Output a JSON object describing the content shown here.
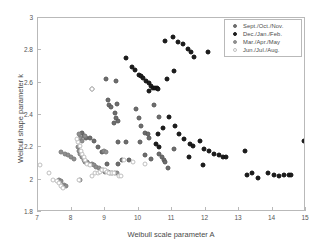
{
  "chart_data": {
    "type": "scatter",
    "title": "",
    "xlabel": "Weibull scale parameter A",
    "ylabel": "Weibull shape parameter k",
    "xlim": [
      7,
      15
    ],
    "ylim": [
      1.8,
      3
    ],
    "xticks": [
      "7",
      "8",
      "9",
      "10",
      "11",
      "12",
      "13",
      "14",
      "15"
    ],
    "yticks": [
      "1.8",
      "2",
      "2.2",
      "2.4",
      "2.6",
      "2.8",
      "3"
    ],
    "grid": false,
    "legend_position": "top-right",
    "series": [
      {
        "name": "Sept./Oct./Nov.",
        "color": "#6d6d6d",
        "marker": "filled-circle-gray",
        "points": [
          [
            8.62,
            2.56
          ],
          [
            9.02,
            2.62
          ],
          [
            9.08,
            2.49
          ],
          [
            9.32,
            2.61
          ],
          [
            9.13,
            2.46
          ],
          [
            9.18,
            2.45
          ],
          [
            9.36,
            2.47
          ],
          [
            9.3,
            2.41
          ],
          [
            9.33,
            2.38
          ],
          [
            9.4,
            2.36
          ],
          [
            9.28,
            2.35
          ],
          [
            9.93,
            2.44
          ],
          [
            10.02,
            2.38
          ],
          [
            10.08,
            2.33
          ],
          [
            10.2,
            2.29
          ],
          [
            10.28,
            2.28
          ],
          [
            10.32,
            2.26
          ],
          [
            10.47,
            2.46
          ],
          [
            10.6,
            2.39
          ],
          [
            10.05,
            2.23
          ],
          [
            9.62,
            2.23
          ],
          [
            9.4,
            2.23
          ],
          [
            10.18,
            2.15
          ],
          [
            10.38,
            2.13
          ],
          [
            10.62,
            2.16
          ],
          [
            10.7,
            2.14
          ],
          [
            10.75,
            2.12
          ],
          [
            10.8,
            2.11
          ],
          [
            9.38,
            2.1
          ],
          [
            9.05,
            2.1
          ],
          [
            8.92,
            2.17
          ],
          [
            8.78,
            2.2
          ],
          [
            8.66,
            2.24
          ],
          [
            8.55,
            2.26
          ],
          [
            8.44,
            2.26
          ],
          [
            8.36,
            2.27
          ],
          [
            8.3,
            2.29
          ],
          [
            8.25,
            2.25
          ],
          [
            9.5,
            2.12
          ],
          [
            9.72,
            2.12
          ],
          [
            10.88,
            2.07
          ],
          [
            11.05,
            2.19
          ]
        ]
      },
      {
        "name": "Dec./Jan./Feb.",
        "color": "#1c1c1c",
        "marker": "filled-circle-black",
        "points": [
          [
            9.62,
            2.75
          ],
          [
            9.82,
            2.7
          ],
          [
            9.9,
            2.68
          ],
          [
            10.02,
            2.65
          ],
          [
            10.08,
            2.64
          ],
          [
            10.14,
            2.63
          ],
          [
            10.22,
            2.61
          ],
          [
            10.3,
            2.6
          ],
          [
            10.36,
            2.58
          ],
          [
            10.42,
            2.57
          ],
          [
            10.48,
            2.57
          ],
          [
            10.54,
            2.57
          ],
          [
            10.32,
            2.55
          ],
          [
            10.8,
            2.86
          ],
          [
            11.02,
            2.88
          ],
          [
            11.18,
            2.85
          ],
          [
            11.32,
            2.84
          ],
          [
            11.48,
            2.81
          ],
          [
            11.58,
            2.79
          ],
          [
            11.65,
            2.76
          ],
          [
            12.08,
            2.79
          ],
          [
            11.05,
            2.67
          ],
          [
            10.85,
            2.62
          ],
          [
            10.58,
            2.56
          ],
          [
            11.22,
            2.28
          ],
          [
            11.35,
            2.25
          ],
          [
            11.55,
            2.22
          ],
          [
            11.62,
            2.21
          ],
          [
            11.85,
            2.24
          ],
          [
            11.95,
            2.19
          ],
          [
            12.1,
            2.18
          ],
          [
            12.25,
            2.16
          ],
          [
            12.4,
            2.15
          ],
          [
            12.52,
            2.14
          ],
          [
            12.6,
            2.14
          ],
          [
            11.5,
            2.14
          ],
          [
            11.92,
            2.09
          ],
          [
            13.18,
            2.18
          ],
          [
            13.25,
            2.03
          ],
          [
            13.38,
            2.04
          ],
          [
            13.58,
            2.01
          ],
          [
            13.88,
            2.04
          ],
          [
            14.05,
            2.03
          ],
          [
            14.18,
            2.02
          ],
          [
            14.35,
            2.03
          ],
          [
            14.48,
            2.03
          ],
          [
            14.55,
            2.03
          ],
          [
            14.95,
            2.24
          ],
          [
            10.92,
            2.39
          ],
          [
            11.1,
            2.33
          ],
          [
            10.72,
            2.32
          ],
          [
            10.58,
            2.28
          ],
          [
            10.52,
            2.22
          ],
          [
            10.62,
            2.2
          ]
        ]
      },
      {
        "name": "Mar./Apr./May",
        "color": "#8f8f8f",
        "marker": "filled-circle-lightgray",
        "points": [
          [
            8.22,
            2.28
          ],
          [
            8.26,
            2.26
          ],
          [
            8.3,
            2.24
          ],
          [
            8.4,
            2.27
          ],
          [
            8.18,
            2.2
          ],
          [
            8.22,
            2.18
          ],
          [
            8.26,
            2.16
          ],
          [
            8.3,
            2.14
          ],
          [
            8.36,
            2.12
          ],
          [
            8.4,
            2.11
          ],
          [
            8.46,
            2.11
          ],
          [
            8.52,
            2.1
          ],
          [
            8.6,
            2.1
          ],
          [
            8.68,
            2.09
          ],
          [
            8.74,
            2.08
          ],
          [
            8.82,
            2.07
          ],
          [
            8.88,
            2.06
          ],
          [
            8.94,
            2.06
          ],
          [
            9.0,
            2.05
          ],
          [
            9.08,
            2.05
          ],
          [
            9.16,
            2.04
          ],
          [
            9.22,
            2.04
          ],
          [
            7.68,
            2.17
          ],
          [
            7.82,
            2.16
          ],
          [
            7.9,
            2.15
          ],
          [
            7.98,
            2.14
          ],
          [
            8.06,
            2.13
          ],
          [
            7.62,
            2.0
          ],
          [
            7.7,
            1.99
          ],
          [
            7.78,
            1.97
          ],
          [
            7.84,
            1.96
          ],
          [
            8.24,
            2.0
          ],
          [
            9.3,
            2.04
          ],
          [
            9.36,
            2.04
          ],
          [
            8.96,
            2.18
          ],
          [
            9.04,
            2.17
          ]
        ]
      },
      {
        "name": "Jun./Jul./Aug.",
        "color": "#d8d8d8",
        "marker": "open-circle",
        "points": [
          [
            7.05,
            2.09
          ],
          [
            7.32,
            2.04
          ],
          [
            7.44,
            2.0
          ],
          [
            7.56,
            1.99
          ],
          [
            7.62,
            1.98
          ],
          [
            7.7,
            1.96
          ],
          [
            7.76,
            1.95
          ],
          [
            8.22,
            2.0
          ],
          [
            8.6,
            2.02
          ],
          [
            8.7,
            2.04
          ],
          [
            8.78,
            2.04
          ],
          [
            8.86,
            2.05
          ],
          [
            8.92,
            2.06
          ],
          [
            9.0,
            2.06
          ],
          [
            9.06,
            2.05
          ],
          [
            9.12,
            2.04
          ],
          [
            9.2,
            2.04
          ],
          [
            9.26,
            2.04
          ],
          [
            8.46,
            2.1
          ],
          [
            8.54,
            2.09
          ],
          [
            8.4,
            2.12
          ],
          [
            8.36,
            2.14
          ],
          [
            8.32,
            2.16
          ],
          [
            8.28,
            2.18
          ],
          [
            8.24,
            2.21
          ],
          [
            8.2,
            2.23
          ],
          [
            8.16,
            2.25
          ],
          [
            9.42,
            2.02
          ],
          [
            9.48,
            2.02
          ],
          [
            9.85,
            2.11
          ],
          [
            10.2,
            2.1
          ],
          [
            9.58,
            2.12
          ],
          [
            8.62,
            2.56
          ]
        ]
      }
    ]
  }
}
